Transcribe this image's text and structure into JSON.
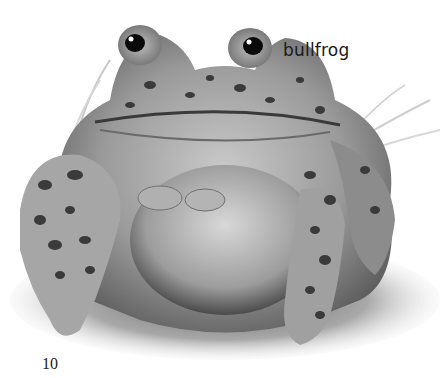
{
  "page": {
    "label": "bullfrog",
    "page_number": "10",
    "illustration": {
      "subject": "bullfrog",
      "style": "grayscale realistic illustration",
      "background": "#ffffff",
      "tones": {
        "skin_light": "#b8b8b8",
        "skin_mid": "#8a8a8a",
        "spots": "#3a3a3a",
        "eye": "#0a0a0a",
        "grass": "#9a9a9a"
      }
    }
  }
}
